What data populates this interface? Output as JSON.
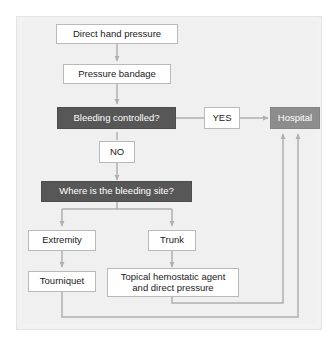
{
  "figure": {
    "type": "flowchart",
    "caption_partial": "",
    "colors": {
      "panel_background": "#f0f0f0",
      "decision_box": "#575757",
      "hospital_box": "#8d8d8d",
      "process_box": "#ffffff",
      "connector": "#b0b0b0",
      "box_border": "#b9b9b9",
      "text_dark": "#1a1a1a",
      "text_light": "#ffffff"
    }
  },
  "nodes": {
    "direct_hand_pressure": {
      "label": "Direct hand pressure",
      "style": "process"
    },
    "pressure_bandage": {
      "label": "Pressure bandage",
      "style": "process"
    },
    "bleeding_controlled": {
      "label": "Bleeding  controlled?",
      "style": "decision"
    },
    "yes_label": {
      "label": "YES",
      "style": "process"
    },
    "no_label": {
      "label": "NO",
      "style": "process"
    },
    "hospital": {
      "label": "Hospital",
      "style": "terminal"
    },
    "bleeding_site": {
      "label": "Where is the bleeding site?",
      "style": "decision"
    },
    "extremity": {
      "label": "Extremity",
      "style": "process"
    },
    "trunk": {
      "label": "Trunk",
      "style": "process"
    },
    "tourniquet": {
      "label": "Tourniquet",
      "style": "process"
    },
    "topical_agent": {
      "label": "Topical hemostatic agent\nand direct pressure",
      "style": "process"
    }
  },
  "edges": [
    {
      "from": "direct_hand_pressure",
      "to": "pressure_bandage",
      "label": ""
    },
    {
      "from": "pressure_bandage",
      "to": "bleeding_controlled",
      "label": ""
    },
    {
      "from": "bleeding_controlled",
      "to": "hospital",
      "label": "YES"
    },
    {
      "from": "bleeding_controlled",
      "to": "bleeding_site",
      "label": "NO"
    },
    {
      "from": "bleeding_site",
      "to": "extremity",
      "label": ""
    },
    {
      "from": "bleeding_site",
      "to": "trunk",
      "label": ""
    },
    {
      "from": "extremity",
      "to": "tourniquet",
      "label": ""
    },
    {
      "from": "trunk",
      "to": "topical_agent",
      "label": ""
    },
    {
      "from": "topical_agent",
      "to": "hospital",
      "label": ""
    },
    {
      "from": "tourniquet",
      "to": "hospital",
      "label": ""
    }
  ]
}
